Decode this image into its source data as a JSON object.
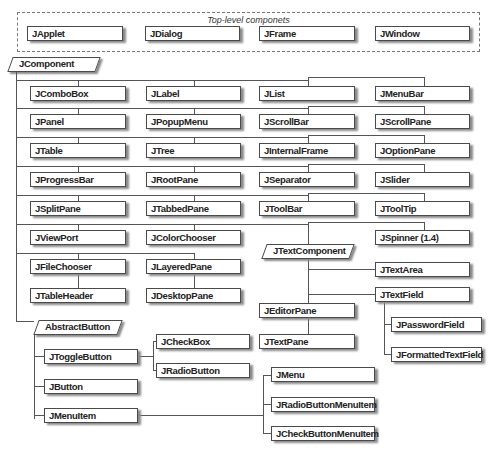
{
  "diagram": {
    "top_level": {
      "title": "Top-level componets",
      "items": [
        "JApplet",
        "JDialog",
        "JFrame",
        "JWindow"
      ]
    },
    "root": "JComponent",
    "grid": [
      [
        "JComboBox",
        "JLabel",
        "JList",
        "JMenuBar"
      ],
      [
        "JPanel",
        "JPopupMenu",
        "JScrollBar",
        "JScrollPane"
      ],
      [
        "JTable",
        "JTree",
        "JInternalFrame",
        "JOptionPane"
      ],
      [
        "JProgressBar",
        "JRootPane",
        "JSeparator",
        "JSlider"
      ],
      [
        "JSplitPane",
        "JTabbedPane",
        "JToolBar",
        "JToolTip"
      ],
      [
        "JViewPort",
        "JColorChooser"
      ],
      [
        "JFileChooser",
        "JLayeredPane"
      ],
      [
        "JTableHeader",
        "JDesktopPane"
      ]
    ],
    "spinner": "JSpinner (1.4)",
    "text_component": {
      "root": "JTextComponent",
      "text_area": "JTextArea",
      "text_field": "JTextField",
      "editor_pane": "JEditorPane",
      "text_pane": "JTextPane",
      "password_field": "JPasswordField",
      "formatted_text_field": "JFormattedTextField"
    },
    "abstract_button": {
      "root": "AbstractButton",
      "toggle_button": "JToggleButton",
      "check_box": "JCheckBox",
      "radio_button": "JRadioButton",
      "button": "JButton",
      "menu_item": "JMenuItem",
      "menu": "JMenu",
      "radio_button_menu_item": "JRadioButtonMenuItem",
      "check_button_menu_item": "JCheckButtonMenuItem"
    }
  }
}
